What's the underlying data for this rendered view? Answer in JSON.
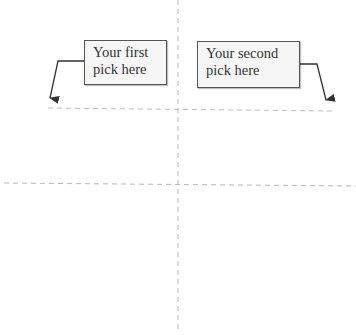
{
  "callouts": [
    {
      "id": "first",
      "lines": [
        "Your first",
        "pick here"
      ]
    },
    {
      "id": "second",
      "lines": [
        "Your second",
        "pick here"
      ]
    }
  ],
  "colors": {
    "background": "#ffffff",
    "dashed_line": "#b8b8b8",
    "arrow": "#333333",
    "box_border": "#555555",
    "box_fill": "#f6f6f6",
    "text": "#333333"
  }
}
